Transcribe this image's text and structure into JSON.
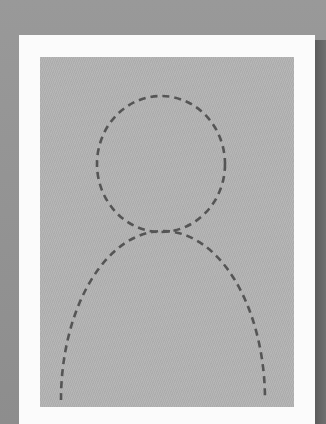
{
  "placeholder": {
    "type": "profile-photo-placeholder",
    "description": "Dashed-outline person silhouette (head and shoulders) on gray photo area with white frame",
    "colors": {
      "background": "#929292",
      "frame": "#fbfbfb",
      "photo_area": "#b2b2b2",
      "outline": "#555555"
    }
  }
}
